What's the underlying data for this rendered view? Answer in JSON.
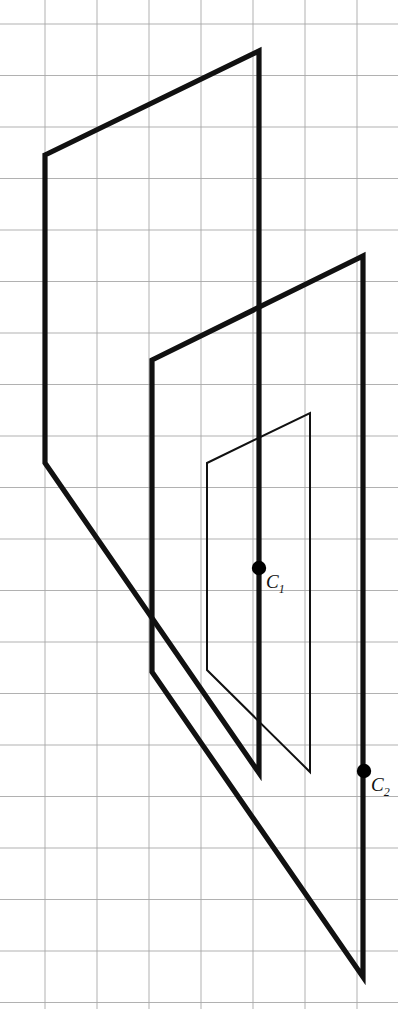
{
  "figure": {
    "canvas": {
      "width": 398,
      "height": 1009
    },
    "colors": {
      "grid": "#a8a8a8",
      "stroke": "#111111",
      "background": "#ffffff",
      "point": "#000000"
    },
    "grid": {
      "visible": true,
      "spacing_x": 52,
      "spacing_y": 51.5,
      "origin_x": 45,
      "origin_y": 24,
      "line_width": 0.9,
      "x_lines": [
        45,
        97,
        149,
        201,
        253,
        305,
        357
      ],
      "y_lines": [
        24,
        75.5,
        127,
        178.5,
        230,
        281.5,
        333,
        384.5,
        436,
        487.5,
        539,
        590.5,
        642,
        693.5,
        745,
        796.5,
        848,
        899.5,
        951,
        1002.5
      ]
    },
    "shapes": [
      {
        "name": "outer-plane",
        "kind": "parallelogram",
        "stroke_width": 5.2,
        "points": [
          [
            45,
            155
          ],
          [
            259,
            51
          ],
          [
            259,
            773
          ],
          [
            45,
            463
          ]
        ]
      },
      {
        "name": "middle-plane",
        "kind": "parallelogram",
        "stroke_width": 5.2,
        "points": [
          [
            152,
            360
          ],
          [
            363,
            256
          ],
          [
            363,
            977
          ],
          [
            152,
            672
          ]
        ]
      },
      {
        "name": "inner-plane",
        "kind": "parallelogram",
        "stroke_width": 2.0,
        "points": [
          [
            207,
            463
          ],
          [
            310,
            413
          ],
          [
            310,
            772
          ],
          [
            207,
            670
          ]
        ]
      }
    ],
    "points": [
      {
        "name": "center-point-c1",
        "label": "C",
        "subscript": "1",
        "x": 259,
        "y": 568,
        "radius": 7.2,
        "label_x": 266,
        "label_y": 572
      },
      {
        "name": "center-point-c2",
        "label": "C",
        "subscript": "2",
        "x": 364,
        "y": 771,
        "radius": 7.2,
        "label_x": 371,
        "label_y": 775
      }
    ]
  }
}
